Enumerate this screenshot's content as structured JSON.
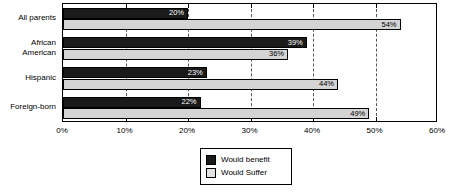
{
  "chart_data": {
    "type": "bar",
    "orientation": "horizontal",
    "title": "",
    "xlabel": "",
    "ylabel": "",
    "xlim": [
      0,
      60
    ],
    "xtick_labels": [
      "0%",
      "10%",
      "20%",
      "30%",
      "40%",
      "50%",
      "60%"
    ],
    "xtick_values": [
      0,
      10,
      20,
      30,
      40,
      50,
      60
    ],
    "grid": true,
    "grid_axis": "x",
    "grid_style": "dashed",
    "legend_position": "bottom-center",
    "categories": [
      "All parents",
      "African\nAmerican",
      "Hispanic",
      "Foreign-born"
    ],
    "series": [
      {
        "name": "Would benefit",
        "color": "#1a1a1a",
        "values": [
          20,
          39,
          23,
          22
        ],
        "labels": [
          "20%",
          "39%",
          "23%",
          "22%"
        ]
      },
      {
        "name": "Would Suffer",
        "color": "#d4d4d4",
        "values": [
          54,
          36,
          44,
          49
        ],
        "labels": [
          "54%",
          "36%",
          "44%",
          "49%"
        ]
      }
    ]
  },
  "legend": {
    "items": [
      {
        "label": "Would benefit",
        "swatch": "black-square"
      },
      {
        "label": "Would Suffer",
        "swatch": "light-gray-square"
      }
    ]
  }
}
